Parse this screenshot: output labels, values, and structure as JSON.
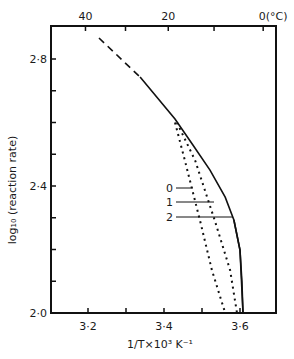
{
  "chart_data": {
    "type": "line",
    "title": "",
    "xlabel": "1/T×10³  K⁻¹",
    "ylabel": "log₁₀ (reaction rate)",
    "top_xlabel": "(°C)",
    "xlim": [
      3.1,
      3.69
    ],
    "ylim": [
      2.0,
      2.9
    ],
    "grid": false,
    "legend": "inline labels with leader lines",
    "x_ticks": [
      3.2,
      3.3,
      3.4,
      3.5,
      3.6
    ],
    "x_tick_labels": [
      "3·2",
      "",
      "3·4",
      "",
      "3·6"
    ],
    "y_ticks": [
      2.0,
      2.1,
      2.2,
      2.3,
      2.4,
      2.5,
      2.6,
      2.7,
      2.8
    ],
    "y_tick_labels": [
      "2·0",
      "",
      "",
      "",
      "2·4",
      "",
      "",
      "",
      "2·8"
    ],
    "top_ticks_celsius": [
      40,
      30,
      20,
      10,
      0
    ],
    "top_tick_labels": [
      "40",
      "",
      "20",
      "",
      "0(°C)"
    ],
    "series": [
      {
        "name": "main (extrapolated)",
        "style": "dashed",
        "x": [
          3.229,
          3.337
        ],
        "y": [
          2.866,
          2.743
        ]
      },
      {
        "name": "main",
        "style": "solid",
        "x": [
          3.337,
          3.429,
          3.476,
          3.521,
          3.561,
          3.584,
          3.6,
          3.605,
          3.608
        ],
        "y": [
          2.743,
          2.611,
          2.529,
          2.45,
          2.365,
          2.293,
          2.198,
          2.1,
          2.0
        ]
      },
      {
        "name": "0",
        "style": "dotted",
        "x": [
          3.429,
          3.455,
          3.495,
          3.526,
          3.561
        ],
        "y": [
          2.6,
          2.48,
          2.29,
          2.135,
          2.0
        ]
      },
      {
        "name": "1",
        "style": "dotted",
        "x": [
          3.434,
          3.482,
          3.534,
          3.574,
          3.592
        ],
        "y": [
          2.6,
          2.48,
          2.29,
          2.135,
          2.0
        ]
      },
      {
        "name": "2",
        "style": "solid",
        "note": "coincides with lower part of main curve",
        "x": [
          3.584,
          3.6,
          3.608
        ],
        "y": [
          2.293,
          2.198,
          2.0
        ]
      }
    ],
    "annotations": [
      {
        "text": "0",
        "x": 3.42,
        "y": 2.39
      },
      {
        "text": "1",
        "x": 3.42,
        "y": 2.35
      },
      {
        "text": "2",
        "x": 3.42,
        "y": 2.3
      }
    ]
  }
}
